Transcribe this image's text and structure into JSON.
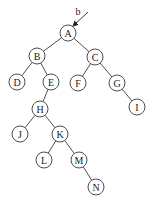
{
  "diagram": {
    "type": "binary-tree",
    "node_radius": 8,
    "colors": {
      "stroke": "#3a3a3a",
      "fill": "#ffffff",
      "text": "#222222"
    },
    "pointer": {
      "label": "b",
      "label_pos": [
        78,
        11
      ],
      "from": [
        88,
        12
      ],
      "to": [
        73,
        26
      ],
      "target": "A"
    },
    "nodes": [
      {
        "id": "A",
        "label": "A",
        "x": 68,
        "y": 33
      },
      {
        "id": "B",
        "label": "B",
        "x": 37,
        "y": 56
      },
      {
        "id": "C",
        "label": "C",
        "x": 95,
        "y": 57
      },
      {
        "id": "D",
        "label": "D",
        "x": 17,
        "y": 82
      },
      {
        "id": "E",
        "label": "E",
        "x": 51,
        "y": 82
      },
      {
        "id": "F",
        "label": "F",
        "x": 78,
        "y": 83
      },
      {
        "id": "G",
        "label": "G",
        "x": 117,
        "y": 83
      },
      {
        "id": "H",
        "label": "H",
        "x": 40,
        "y": 109
      },
      {
        "id": "I",
        "label": "I",
        "x": 137,
        "y": 107
      },
      {
        "id": "J",
        "label": "J",
        "x": 20,
        "y": 134
      },
      {
        "id": "K",
        "label": "K",
        "x": 60,
        "y": 134
      },
      {
        "id": "L",
        "label": "L",
        "x": 44,
        "y": 160
      },
      {
        "id": "M",
        "label": "M",
        "x": 79,
        "y": 160
      },
      {
        "id": "N",
        "label": "N",
        "x": 96,
        "y": 187
      }
    ],
    "edges": [
      {
        "from": "A",
        "to": "B"
      },
      {
        "from": "A",
        "to": "C"
      },
      {
        "from": "B",
        "to": "D"
      },
      {
        "from": "B",
        "to": "E"
      },
      {
        "from": "C",
        "to": "F"
      },
      {
        "from": "C",
        "to": "G"
      },
      {
        "from": "E",
        "to": "H"
      },
      {
        "from": "G",
        "to": "I"
      },
      {
        "from": "H",
        "to": "J"
      },
      {
        "from": "H",
        "to": "K"
      },
      {
        "from": "K",
        "to": "L"
      },
      {
        "from": "K",
        "to": "M"
      },
      {
        "from": "M",
        "to": "N"
      }
    ]
  }
}
